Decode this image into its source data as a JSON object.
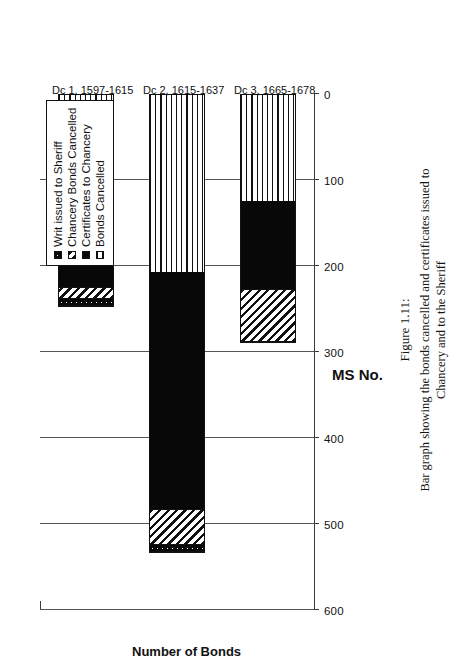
{
  "figure": {
    "caption_title": "Figure 1.11:",
    "caption_body": "Bar graph showing the bonds cancelled and certificates issued to Chancery and to the Sheriff"
  },
  "chart_data": {
    "type": "bar",
    "orientation": "vertical-rotated",
    "stacked": true,
    "title": "",
    "xlabel": "MS No.",
    "ylabel": "Number of Bonds",
    "ylim": [
      0,
      600
    ],
    "yticks": [
      0,
      100,
      200,
      300,
      400,
      500,
      600
    ],
    "ytick_labels": [
      "0",
      "100",
      "200",
      "300",
      "400",
      "500",
      "600"
    ],
    "grid": true,
    "legend_position": "top-right",
    "categories": [
      "Dc 1, 1597-1615",
      "Dc 2, 1615-1637",
      "Dc 3, 1665-1678"
    ],
    "series": [
      {
        "name": "Bonds Cancelled",
        "pattern": "horizontal-lines",
        "values": [
          100,
          207,
          124
        ]
      },
      {
        "name": "Certificates to Chancery",
        "pattern": "solid-black",
        "values": [
          126,
          278,
          105
        ]
      },
      {
        "name": "Chancery Bonds Cancelled",
        "pattern": "diagonal-hatch",
        "values": [
          13,
          40,
          60
        ]
      },
      {
        "name": "Writ issued to Sheriff",
        "pattern": "dotted-black",
        "values": [
          9,
          9,
          0
        ]
      }
    ],
    "totals": [
      248,
      534,
      289
    ]
  },
  "legend": {
    "items": [
      {
        "label": "Writ issued to Sheriff",
        "swatch": "dotted-black-swatch"
      },
      {
        "label": "Chancery Bonds Cancelled",
        "swatch": "diagonal-hatch-swatch"
      },
      {
        "label": "Certificates to Chancery",
        "swatch": "solid-black-swatch"
      },
      {
        "label": "Bonds Cancelled",
        "swatch": "horizontal-lines-swatch"
      }
    ]
  }
}
